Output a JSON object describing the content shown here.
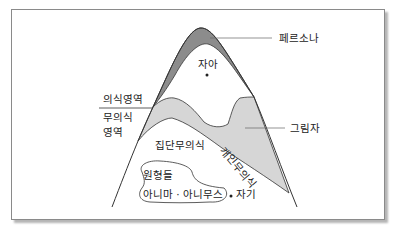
{
  "diagram": {
    "labels": {
      "persona": "페르소나",
      "ego": "자아",
      "conscious_area": "의식영역",
      "unconscious_area_line1": "무의식",
      "unconscious_area_line2": "영역",
      "shadow": "그림자",
      "personal_unconscious": "개인무의식",
      "collective_unconscious": "집단무의식",
      "archetypes": "원형들",
      "anima_animus": "아니마 · 아니무스",
      "self": "자기"
    },
    "colors": {
      "persona_fill": "#8c8c8c",
      "personal_unconscious_fill": "#d6d6d6",
      "line": "#333333",
      "frame_border": "#8a8a8a",
      "shadow": "#b5b5b5"
    }
  }
}
